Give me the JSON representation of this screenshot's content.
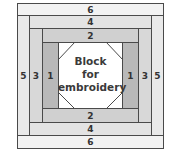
{
  "diagram": {
    "type": "log-cabin-quilt-block",
    "center_label": [
      "Block",
      "for",
      "embroidery"
    ],
    "strips": {
      "top_6": "6",
      "top_4": "4",
      "top_2": "2",
      "bottom_2": "2",
      "bottom_4": "4",
      "bottom_6": "6",
      "left_5": "5",
      "left_3": "3",
      "left_1": "1",
      "right_1": "1",
      "right_3": "3",
      "right_5": "5"
    },
    "colors": {
      "strip_1": "#b9b9b9",
      "strip_2": "#d0d0d0",
      "strip_3": "#d8d8d8",
      "strip_4": "#e3e3e3",
      "strip_5": "#e9e9e9",
      "strip_6": "#f2f2f2",
      "border": "#4a4a4a",
      "center": "#ffffff"
    }
  }
}
